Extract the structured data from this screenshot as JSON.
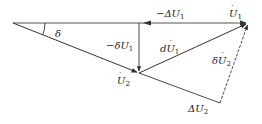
{
  "diagram": {
    "type": "phasor-diagram",
    "angle_label": "δ",
    "labels": {
      "U1": "U̇₁",
      "U2": "U̇₂",
      "minus_delta_U1": "−ΔU₁",
      "minus_small_delta_U1": "−δU₁",
      "dU1": "dU̇₁",
      "small_delta_U2": "δU̇₂",
      "delta_U2": "ΔU₂"
    },
    "points": {
      "origin": [
        13,
        23
      ],
      "U1_tip": [
        248,
        23
      ],
      "U2_tip": [
        139,
        73
      ],
      "corner": [
        220,
        103
      ]
    },
    "colors": {
      "line": "#333333",
      "text": "#222222"
    }
  }
}
